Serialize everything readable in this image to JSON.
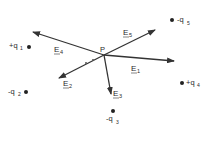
{
  "diagram": {
    "point": {
      "label": "P",
      "x": 104,
      "y": 55
    },
    "charges": [
      {
        "id": "q1",
        "label": "+q",
        "sub": "1",
        "x": 29,
        "y": 47
      },
      {
        "id": "q2",
        "label": "-q",
        "sub": "2",
        "x": 26,
        "y": 92
      },
      {
        "id": "q3",
        "label": "-q",
        "sub": "3",
        "x": 113,
        "y": 111
      },
      {
        "id": "q4",
        "label": "+q",
        "sub": "4",
        "x": 182,
        "y": 83
      },
      {
        "id": "q5",
        "label": "-q",
        "sub": "5",
        "x": 172,
        "y": 20
      }
    ],
    "vectors": [
      {
        "id": "E1",
        "label": "E",
        "sub": "1",
        "x2": 174,
        "y2": 61
      },
      {
        "id": "E2",
        "label": "E",
        "sub": "2",
        "x2": 59,
        "y2": 78
      },
      {
        "id": "E3",
        "label": "E",
        "sub": "3",
        "x2": 111,
        "y2": 94
      },
      {
        "id": "E4",
        "label": "E",
        "sub": "4",
        "x2": 33,
        "y2": 32
      },
      {
        "id": "E5",
        "label": "E",
        "sub": "5",
        "x2": 155,
        "y2": 30
      }
    ]
  }
}
